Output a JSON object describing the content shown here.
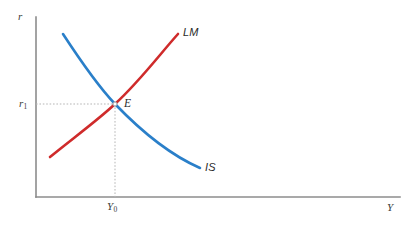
{
  "figure": {
    "title": "",
    "kind": "is-lm-diagram"
  },
  "axes": {
    "y_axis_label": "r",
    "x_axis_label": "Y",
    "axis_color": "#8c8c8c",
    "origin": {
      "x": 36,
      "y": 197
    },
    "y_axis_top": 17,
    "x_axis_right": 400
  },
  "ticks": {
    "y": [
      {
        "label_text": "r",
        "subscript": "1",
        "value_y": 104
      }
    ],
    "x": [
      {
        "label_text": "Y",
        "subscript": "0",
        "value_x": 115
      }
    ]
  },
  "guides": {
    "color": "#b5b5b5",
    "horizontal": {
      "from_x": 36,
      "to_x": 115,
      "y": 104
    },
    "vertical": {
      "x": 115,
      "from_y": 104,
      "to_y": 197
    }
  },
  "equilibrium": {
    "label": "E",
    "x": 115,
    "y": 104,
    "marker_color": "#9a9a9a"
  },
  "curves": [
    {
      "name": "IS",
      "label": "IS",
      "color": "#2a7fc9",
      "slope": "downward",
      "width": 2.6,
      "path": "M 63 34 C 80 60, 98 86, 115 104 C 140 130, 168 154, 200 168"
    },
    {
      "name": "LM",
      "label": "LM",
      "color": "#cf2b2b",
      "slope": "upward",
      "width": 2.6,
      "path": "M 50 157 C 72 139, 98 120, 115 104 C 140 81, 160 54, 178 34"
    }
  ],
  "colors": {
    "background": "#ffffff",
    "is_curve": "#2a7fc9",
    "lm_curve": "#cf2b2b",
    "axis": "#8c8c8c",
    "guide": "#b5b5b5",
    "text": "#2b2b2b"
  }
}
